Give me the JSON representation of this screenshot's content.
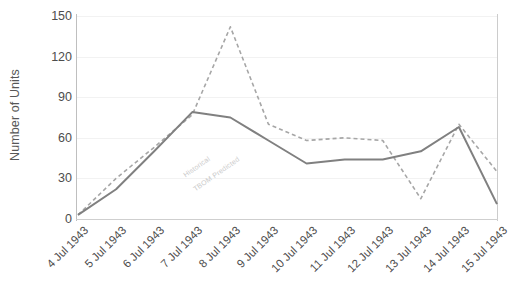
{
  "chart_data": {
    "type": "line",
    "title": "",
    "xlabel": "",
    "ylabel": "Number of Units",
    "ylim": [
      0,
      150
    ],
    "yticks": [
      0,
      30,
      60,
      90,
      120,
      150
    ],
    "grid": true,
    "legend_position": "inline-on-series",
    "categories": [
      "4 Jul 1943",
      "5 Jul 1943",
      "6 Jul 1943",
      "7 Jul 1943",
      "8 Jul 1943",
      "9 Jul 1943",
      "10 Jul 1943",
      "11 Jul 1943",
      "12 Jul 1943",
      "13 Jul 1943",
      "14 Jul 1943",
      "15 Jul 1943"
    ],
    "series": [
      {
        "name": "Historical",
        "style": "solid",
        "color": "#808080",
        "values": [
          3,
          22,
          50,
          79,
          75,
          58,
          41,
          44,
          44,
          50,
          68,
          11
        ]
      },
      {
        "name": "TBOM Predicted",
        "style": "dashed",
        "color": "#a6a6a6",
        "values": [
          3,
          30,
          53,
          77,
          142,
          70,
          58,
          60,
          58,
          15,
          70,
          35
        ]
      }
    ],
    "annotations": [
      {
        "name": "Historical",
        "text": "Historical"
      },
      {
        "name": "TBOM Predicted",
        "text": "TBOM Predicted"
      }
    ]
  },
  "axes": {
    "y_title": "Number of Units",
    "y_tick_labels": [
      "150",
      "120",
      "90",
      "60",
      "30",
      "0"
    ],
    "x_tick_labels": [
      "4 Jul 1943",
      "5 Jul 1943",
      "6 Jul 1943",
      "7 Jul 1943",
      "8 Jul 1943",
      "9 Jul 1943",
      "10 Jul 1943",
      "11 Jul 1943",
      "12 Jul 1943",
      "13 Jul 1943",
      "14 Jul 1943",
      "15 Jul 1943"
    ]
  },
  "series_labels": {
    "historical": "Historical",
    "predicted": "TBOM Predicted"
  },
  "colors": {
    "historical": "#808080",
    "predicted": "#a6a6a6",
    "axis": "#bfbfbf",
    "grid": "#f2f2f2",
    "text": "#4d4d4d"
  }
}
